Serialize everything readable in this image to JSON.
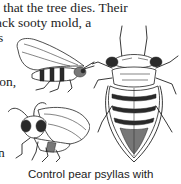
{
  "page": {
    "type": "scanned book page",
    "body_text_lines": [
      "t that the tree dies. Their",
      "ack sooty mold, a",
      "s",
      "",
      "son,",
      "",
      "",
      "",
      "n"
    ],
    "caption": "Control pear psyllas with"
  },
  "illustrations": [
    {
      "name": "winged-adult-psylla-side-view",
      "position": "upper-left"
    },
    {
      "name": "nymph-psylla-top-view",
      "position": "right"
    },
    {
      "name": "adult-psylla-front-view",
      "position": "lower-left"
    }
  ]
}
